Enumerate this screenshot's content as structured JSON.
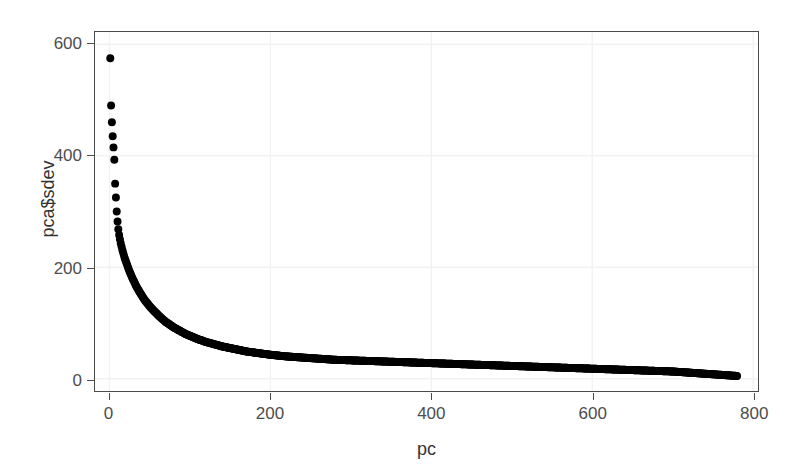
{
  "chart_data": {
    "type": "scatter",
    "title": "",
    "subtitle": "",
    "xlabel": "pc",
    "ylabel": "pca$sdev",
    "xlim": [
      -18,
      806
    ],
    "ylim": [
      -22,
      622
    ],
    "xticks": [
      0,
      200,
      400,
      600,
      800
    ],
    "yticks": [
      0,
      200,
      400,
      600
    ],
    "grid": true,
    "legend": null,
    "n_points": 780,
    "marker": {
      "shape": "circle",
      "color": "#000000",
      "size_px": 8
    },
    "x": [
      1,
      2,
      3,
      4,
      5,
      6,
      7,
      8,
      9,
      10,
      11,
      12,
      13,
      14,
      15,
      16,
      17,
      18,
      19,
      20,
      22,
      24,
      26,
      28,
      30,
      33,
      36,
      39,
      42,
      45,
      50,
      55,
      60,
      65,
      70,
      75,
      80,
      85,
      90,
      95,
      100,
      110,
      120,
      130,
      140,
      150,
      160,
      170,
      180,
      190,
      200,
      220,
      240,
      260,
      280,
      300,
      320,
      340,
      360,
      380,
      400,
      420,
      440,
      460,
      480,
      500,
      520,
      540,
      560,
      580,
      600,
      620,
      640,
      660,
      680,
      700,
      720,
      740,
      760,
      780
    ],
    "y": [
      575,
      490,
      460,
      435,
      415,
      393,
      350,
      325,
      300,
      282,
      268,
      258,
      250,
      243,
      237,
      231,
      226,
      221,
      216,
      212,
      204,
      196,
      189,
      182,
      176,
      167,
      159,
      152,
      145,
      139,
      130,
      122,
      115,
      108,
      102,
      97,
      92,
      88,
      84,
      80,
      77,
      71,
      66,
      62,
      58,
      55,
      52,
      49,
      47,
      45,
      43,
      40,
      38,
      36,
      34,
      33,
      32,
      31,
      30,
      29,
      28,
      27,
      26,
      25,
      24,
      23,
      22,
      21,
      20,
      19,
      18,
      17,
      16,
      15,
      14,
      13,
      11,
      9,
      7,
      5
    ],
    "axis_color": "#4a4a4a",
    "grid_color": "#f2f2f2",
    "tick_label_color": "#4d4d4d",
    "background": "#ffffff"
  }
}
